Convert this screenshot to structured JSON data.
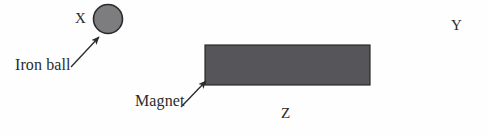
{
  "figure": {
    "name": "iron-ball-and-magnet-diagram",
    "background_color": "#fefefe",
    "width": 488,
    "height": 135
  },
  "labels": {
    "point_x": "X",
    "point_y": "Y",
    "point_z": "Z",
    "iron_ball": "Iron ball",
    "magnet": "Magnet"
  },
  "shapes": {
    "iron_ball": {
      "name": "iron-ball-circle",
      "fill": "#7d7d80",
      "stroke": "#2b2b2b",
      "stroke_width": 1.6,
      "center_x": 108,
      "center_y": 19,
      "radius": 14.5
    },
    "magnet": {
      "name": "magnet-rectangle",
      "fill": "#55555a",
      "stroke": "#2b2b2b",
      "stroke_width": 1.2,
      "x": 205,
      "y": 45,
      "width": 165,
      "height": 40
    }
  },
  "arrows": {
    "iron_ball_pointer": {
      "name": "iron-ball-arrow",
      "color": "#2b2b2b",
      "from_x": 71,
      "from_y": 67,
      "to_x": 99,
      "to_y": 37
    },
    "magnet_pointer": {
      "name": "magnet-arrow",
      "color": "#2b2b2b",
      "from_x": 181,
      "from_y": 107,
      "to_x": 206,
      "to_y": 81
    }
  },
  "colors": {
    "ink": "#2b2b2b",
    "ball_gray": "#7d7d80",
    "magnet_gray": "#55555a",
    "page": "#fefefe"
  }
}
